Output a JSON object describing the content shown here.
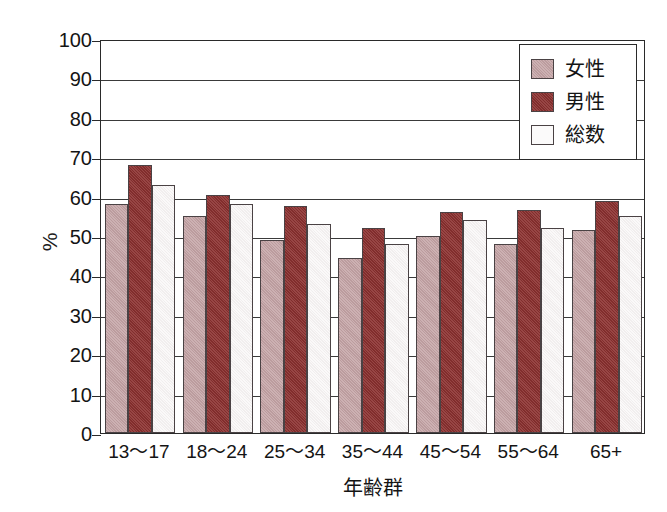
{
  "chart_data": {
    "type": "bar",
    "title": "",
    "subtitle": "",
    "xlabel": "年齢群",
    "ylabel": "%",
    "categories": [
      "13〜17",
      "18〜24",
      "25〜34",
      "35〜44",
      "45〜54",
      "55〜64",
      "65+"
    ],
    "series": [
      {
        "name": "女性",
        "color": "#c3a2a4",
        "values": [
          58,
          55,
          49,
          44.5,
          50,
          48,
          51.5
        ]
      },
      {
        "name": "男性",
        "color": "#8c3130",
        "values": [
          68,
          60.5,
          57.5,
          52,
          56,
          56.5,
          59
        ]
      },
      {
        "name": "総数",
        "color": "#f6f3f3",
        "values": [
          63,
          58,
          53,
          48,
          54,
          52,
          55
        ]
      }
    ],
    "ylim": [
      0,
      100
    ],
    "ytick_step": 10,
    "yticks": [
      0,
      10,
      20,
      30,
      40,
      50,
      60,
      70,
      80,
      90,
      100
    ],
    "ytick_labels": [
      "0",
      "10",
      "20",
      "30",
      "40",
      "50",
      "60",
      "70",
      "80",
      "90",
      "100"
    ],
    "grid": "horizontal",
    "legend_position": "top-right",
    "frame": true
  },
  "legend": {
    "items": [
      {
        "label": "女性",
        "swatch": "female"
      },
      {
        "label": "男性",
        "swatch": "male"
      },
      {
        "label": "総数",
        "swatch": "total"
      }
    ]
  },
  "axes": {
    "y_title": "%",
    "x_title": "年齢群"
  }
}
